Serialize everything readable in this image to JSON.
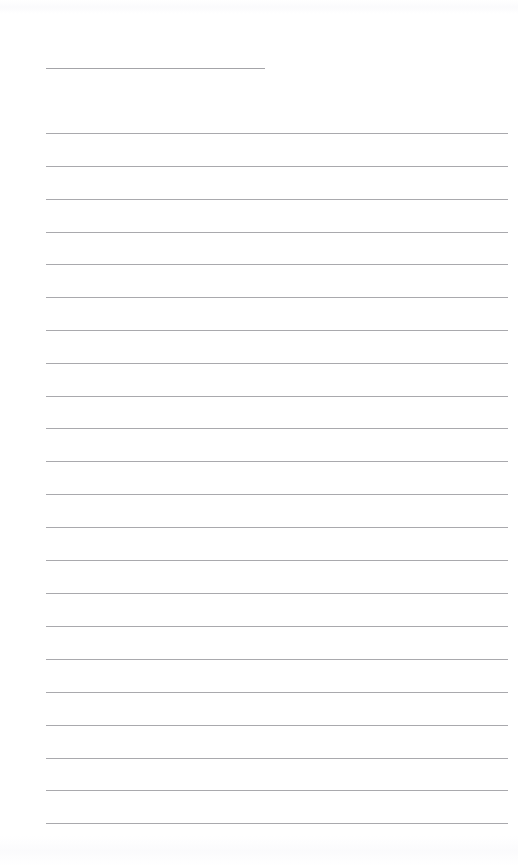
{
  "document": {
    "title": "Blank Ruled Note Page",
    "kind": "scanned-lined-paper",
    "page_width": 518,
    "page_height": 866,
    "background_color": "#ffffff",
    "has_text_content": false,
    "description": "A blank scanned sheet of ruled writing paper. One short horizontal rule near the top, followed by a column of evenly spaced full-width horizontal rules. No printed or handwritten text is present."
  },
  "ruling": {
    "line_color": "#a9a9ad",
    "line_thickness_px": 1,
    "left_margin_px": 46,
    "right_edge_px": 508,
    "line_spacing_px": 32.8,
    "first_body_line_y_px": 133,
    "last_body_line_y_px": 823,
    "body_line_count": 22
  },
  "short_rule": {
    "name": "title-rule",
    "y_px": 68,
    "x_start_px": 46,
    "x_end_px": 265,
    "width_px": 219,
    "color": "#a4a4a8"
  },
  "body_rules": [
    {
      "index": 1,
      "y_px": 133
    },
    {
      "index": 2,
      "y_px": 166
    },
    {
      "index": 3,
      "y_px": 199
    },
    {
      "index": 4,
      "y_px": 232
    },
    {
      "index": 5,
      "y_px": 264
    },
    {
      "index": 6,
      "y_px": 297
    },
    {
      "index": 7,
      "y_px": 330
    },
    {
      "index": 8,
      "y_px": 363
    },
    {
      "index": 9,
      "y_px": 396
    },
    {
      "index": 10,
      "y_px": 428
    },
    {
      "index": 11,
      "y_px": 461
    },
    {
      "index": 12,
      "y_px": 494
    },
    {
      "index": 13,
      "y_px": 527
    },
    {
      "index": 14,
      "y_px": 560
    },
    {
      "index": 15,
      "y_px": 593
    },
    {
      "index": 16,
      "y_px": 626
    },
    {
      "index": 17,
      "y_px": 659
    },
    {
      "index": 18,
      "y_px": 692
    },
    {
      "index": 19,
      "y_px": 725
    },
    {
      "index": 20,
      "y_px": 758
    },
    {
      "index": 21,
      "y_px": 790
    },
    {
      "index": 22,
      "y_px": 823
    }
  ]
}
